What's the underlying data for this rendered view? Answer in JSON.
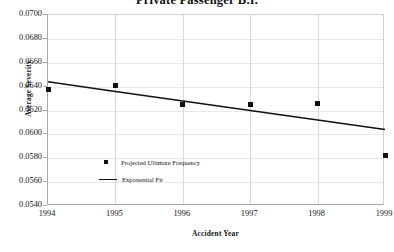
{
  "chart_data": {
    "type": "scatter",
    "title": "Private Passenger B.I.",
    "xlabel": "Accident Year",
    "ylabel": "Average Severity",
    "x": [
      1994,
      1995,
      1996,
      1997,
      1998,
      1999
    ],
    "xtick_labels": [
      "1994",
      "1995",
      "1996",
      "1997",
      "1998",
      "1999"
    ],
    "xlim": [
      1994,
      1999
    ],
    "ylim": [
      0.054,
      0.07
    ],
    "ytick_labels": [
      "0.0700",
      "0.0680",
      "0.0660",
      "0.0640",
      "0.0620",
      "0.0600",
      "0.0580",
      "0.0560",
      "0.0540"
    ],
    "ytick_values": [
      0.07,
      0.068,
      0.066,
      0.064,
      0.062,
      0.06,
      0.058,
      0.056,
      0.054
    ],
    "grid": true,
    "legend_position": "center-left-inside",
    "series": [
      {
        "name": "Projected Ultimate Frequency",
        "marker": "square",
        "color": "#101010",
        "values": [
          0.0638,
          0.0641,
          0.0625,
          0.0625,
          0.0626,
          0.0582
        ]
      },
      {
        "name": "Exponential Fit",
        "marker": "line",
        "color": "#101010",
        "values": [
          0.0644,
          0.0636,
          0.0628,
          0.062,
          0.0612,
          0.0604
        ]
      }
    ]
  },
  "legend": {
    "entries": [
      {
        "label": "Projected Ultimate Frequency"
      },
      {
        "label": "Exponential Fit"
      }
    ]
  }
}
